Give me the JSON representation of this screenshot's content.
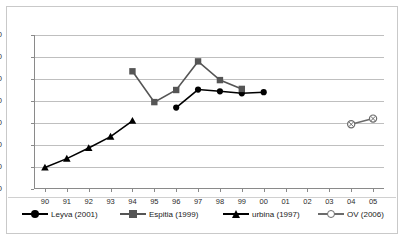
{
  "chart_data": {
    "type": "line",
    "title": "",
    "xlabel": "",
    "ylabel": "",
    "ylim": [
      0,
      70
    ],
    "ystep": 10,
    "grid": true,
    "legend_position": "bottom",
    "categories": [
      "90",
      "91",
      "92",
      "93",
      "94",
      "95",
      "96",
      "97",
      "98",
      "99",
      "00",
      "01",
      "02",
      "03",
      "04",
      "05"
    ],
    "yticks": [
      "0",
      "10",
      "20",
      "30",
      "40",
      "50",
      "60",
      "70"
    ],
    "series": [
      {
        "name": "Leyva (2001)",
        "marker": "circle",
        "color": "#000000",
        "x": [
          "96",
          "97",
          "98",
          "99",
          "00"
        ],
        "values": [
          37,
          45.2,
          44.4,
          43.5,
          44
        ]
      },
      {
        "name": "Espitia (1999)",
        "marker": "square",
        "color": "#555555",
        "x": [
          "94",
          "95",
          "96",
          "97",
          "98",
          "99"
        ],
        "values": [
          53.5,
          39.5,
          45,
          58,
          49.5,
          45.5
        ]
      },
      {
        "name": "urbina (1997)",
        "marker": "triangle",
        "color": "#000000",
        "x": [
          "90",
          "91",
          "92",
          "93",
          "94"
        ],
        "values": [
          9.8,
          13.8,
          18.6,
          23.8,
          31
        ]
      },
      {
        "name": "OV (2006)",
        "marker": "circled-x",
        "color": "#6b6b6b",
        "x": [
          "04",
          "05"
        ],
        "values": [
          29.4,
          32
        ]
      }
    ]
  },
  "legend": {
    "items": [
      {
        "label": "Leyva (2001)"
      },
      {
        "label": "Espitia (1999)"
      },
      {
        "label": "urbina (1997)"
      },
      {
        "label": "OV (2006)"
      }
    ]
  }
}
